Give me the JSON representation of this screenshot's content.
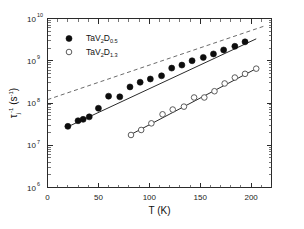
{
  "chart_data": {
    "type": "scatter",
    "title": "",
    "xlabel": "T  (K)",
    "ylabel": "τⱼ⁻¹  (s⁻¹)",
    "ylabel_parts": {
      "tau": "τ",
      "tau_sub": "j",
      "tau_sup": "-1",
      "unit_open": "(s",
      "unit_sup": "-1",
      "unit_close": ")"
    },
    "xlim": [
      0,
      220
    ],
    "ylim": [
      1000000.0,
      10000000000.0
    ],
    "yscale": "log",
    "xscale": "linear",
    "grid": false,
    "legend_position": "upper-left",
    "xticks": [
      0,
      50,
      100,
      150,
      200
    ],
    "xtick_labels": [
      "0",
      "50",
      "100",
      "150",
      "200"
    ],
    "yticks": [
      1000000.0,
      10000000.0,
      100000000.0,
      1000000000.0,
      10000000000.0
    ],
    "ytick_labels": [
      "10",
      "10",
      "10",
      "10",
      "10"
    ],
    "ytick_exponents": [
      "6",
      "7",
      "8",
      "9",
      "10"
    ],
    "series": [
      {
        "name": "TaV2D0.5",
        "legend_label_base": "TaV",
        "legend_sub1": "2",
        "legend_mid": "D",
        "legend_sub2": "0.5",
        "marker": "filled-circle",
        "color": "#0d0d0d",
        "x": [
          20,
          30,
          35,
          41,
          50,
          60,
          71,
          81,
          91,
          101,
          112,
          122,
          132,
          142,
          153,
          163,
          173,
          184,
          194
        ],
        "y": [
          28000000.0,
          38000000.0,
          41000000.0,
          47000000.0,
          75000000.0,
          145000000.0,
          140000000.0,
          240000000.0,
          310000000.0,
          370000000.0,
          440000000.0,
          670000000.0,
          790000000.0,
          1000000000.0,
          1200000000.0,
          1450000000.0,
          1800000000.0,
          2200000000.0,
          2800000000.0
        ],
        "fit_line": {
          "x1": 18,
          "y1": 26000000.0,
          "x2": 205,
          "y2": 3300000000.0
        }
      },
      {
        "name": "TaV2D1.3",
        "legend_label_base": "TaV",
        "legend_sub1": "2",
        "legend_mid": "D",
        "legend_sub2": "1.3",
        "marker": "open-circle",
        "color": "#4a4a4a",
        "x": [
          82,
          92,
          102,
          113,
          123,
          134,
          144,
          154,
          164,
          174,
          184,
          194,
          205
        ],
        "y": [
          17500000.0,
          23000000.0,
          33000000.0,
          54000000.0,
          70000000.0,
          82000000.0,
          135000000.0,
          135000000.0,
          190000000.0,
          290000000.0,
          400000000.0,
          490000000.0,
          650000000.0
        ],
        "fit_line": {
          "x1": 80,
          "y1": 17000000.0,
          "x2": 207,
          "y2": 690000000.0
        }
      }
    ],
    "annotations": [
      {
        "name": "dashed-guide-line",
        "style": "dashed",
        "color": "#5a5a5a",
        "x1": 0,
        "y1": 120000000.0,
        "x2": 212,
        "y2": 6500000000.0
      }
    ]
  },
  "legend": {
    "entries": [
      {
        "marker": "filled-circle",
        "base": "TaV",
        "sub1": "2",
        "mid": "D",
        "sub2": "0.5"
      },
      {
        "marker": "open-circle",
        "base": "TaV",
        "sub1": "2",
        "mid": "D",
        "sub2": "1.3"
      }
    ]
  },
  "colors": {
    "background": "#ffffff",
    "axis": "#2a2a2a",
    "filled_marker": "#0d0d0d",
    "open_marker": "#4a4a4a",
    "dashed_guide": "#5a5a5a"
  }
}
